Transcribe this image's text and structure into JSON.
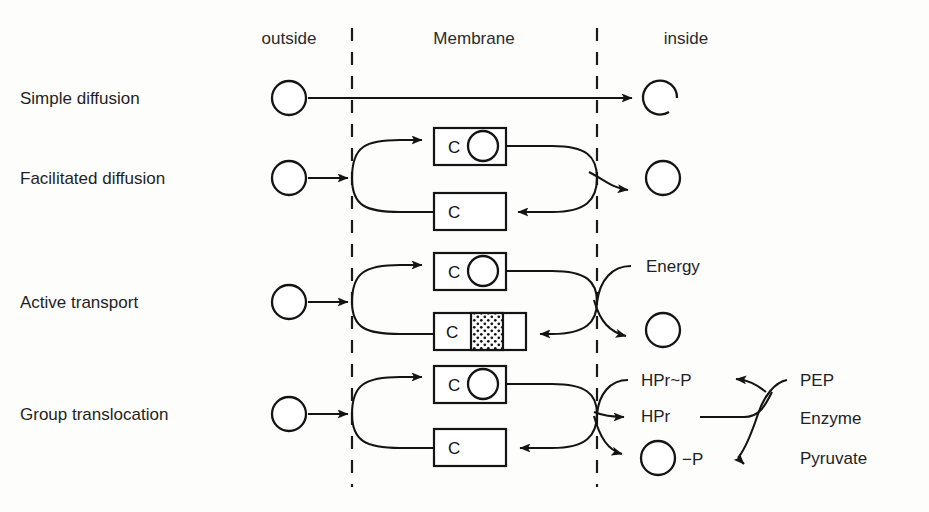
{
  "figure": {
    "background_color": "#fdfdfc",
    "ink_color": "#141414"
  },
  "columns": [
    {
      "id": "outside",
      "label": "outside",
      "x": 289
    },
    {
      "id": "membrane",
      "label": "Membrane",
      "x": 474
    },
    {
      "id": "inside",
      "label": "inside",
      "x": 686
    }
  ],
  "membrane_boundaries": {
    "outer_x": 352,
    "inner_x": 597,
    "top_y": 28,
    "bottom_y": 487,
    "style": "dashed"
  },
  "rows": [
    {
      "id": "simple-diffusion",
      "label": "Simple diffusion",
      "label_y": 98,
      "solute_outside": true,
      "solute_inside": true,
      "carrier_boxes": [],
      "annotations": []
    },
    {
      "id": "facilitated-diffusion",
      "label": "Facilitated diffusion",
      "label_y": 178,
      "solute_outside": true,
      "solute_inside": true,
      "carrier_boxes": [
        {
          "letter": "C",
          "loaded": true,
          "stippled": false
        },
        {
          "letter": "C",
          "loaded": false,
          "stippled": false
        }
      ],
      "annotations": []
    },
    {
      "id": "active-transport",
      "label": "Active   transport",
      "label_y": 302,
      "solute_outside": true,
      "solute_inside": true,
      "carrier_boxes": [
        {
          "letter": "C",
          "loaded": true,
          "stippled": false
        },
        {
          "letter": "C",
          "loaded": false,
          "stippled": true
        }
      ],
      "annotations": [
        {
          "id": "energy",
          "text": "Energy",
          "x": 646,
          "y": 272
        }
      ]
    },
    {
      "id": "group-translocation",
      "label": "Group translocation",
      "label_y": 414,
      "solute_outside": true,
      "solute_inside": true,
      "carrier_boxes": [
        {
          "letter": "C",
          "loaded": true,
          "stippled": false
        },
        {
          "letter": "C",
          "loaded": false,
          "stippled": false
        }
      ],
      "annotations": [
        {
          "id": "hpr-p",
          "text": "HPr~P",
          "x": 641,
          "y": 386
        },
        {
          "id": "hpr",
          "text": "HPr",
          "x": 641,
          "y": 422
        },
        {
          "id": "solute-p",
          "text": "−P",
          "x": 682,
          "y": 462
        },
        {
          "id": "pep",
          "text": "PEP",
          "x": 800,
          "y": 386
        },
        {
          "id": "enzyme",
          "text": "Enzyme",
          "x": 800,
          "y": 424
        },
        {
          "id": "pyruvate",
          "text": "Pyruvate",
          "x": 800,
          "y": 463
        }
      ]
    }
  ],
  "row_label_x": 20,
  "header_y": 44
}
